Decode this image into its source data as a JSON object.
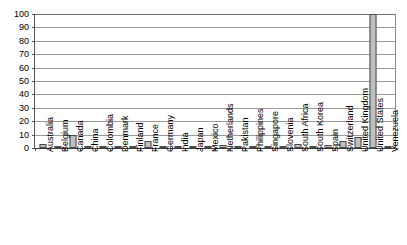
{
  "chart_data": {
    "type": "bar",
    "title": "",
    "subtitle": "",
    "xlabel": "",
    "ylabel": "",
    "ylim": [
      0,
      100
    ],
    "yticks": [
      0,
      10,
      20,
      30,
      40,
      50,
      60,
      70,
      80,
      90,
      100
    ],
    "grid": true,
    "legend": "none",
    "categories": [
      "Australia",
      "Belgium",
      "Canada",
      "China",
      "Colombia",
      "Denmark",
      "Finland",
      "France",
      "Germany",
      "India",
      "Japan",
      "Mexico",
      "Netherlands",
      "Pakistan",
      "Philippines",
      "Singapore",
      "Slovenia",
      "South Africa",
      "South Korea",
      "Spain",
      "Switzerland",
      "United Kingdom",
      "United States",
      "Venezuela"
    ],
    "values": [
      3,
      1,
      10,
      1,
      1,
      1,
      1,
      5,
      1,
      1,
      1,
      1,
      2,
      1,
      1,
      1,
      1,
      3,
      1,
      2,
      5,
      8,
      100,
      1
    ],
    "series": [
      {
        "name": "Series 1",
        "values": [
          3,
          1,
          10,
          1,
          1,
          1,
          1,
          5,
          1,
          1,
          1,
          1,
          2,
          1,
          1,
          1,
          1,
          3,
          1,
          2,
          5,
          8,
          100,
          1
        ]
      }
    ],
    "colors": {
      "bar_fill": "#bfbfbf",
      "bar_border": "#4a4a4a",
      "gridline": "#9a9a9a",
      "axis": "#555555",
      "text": "#000000",
      "background": "#ffffff"
    }
  }
}
